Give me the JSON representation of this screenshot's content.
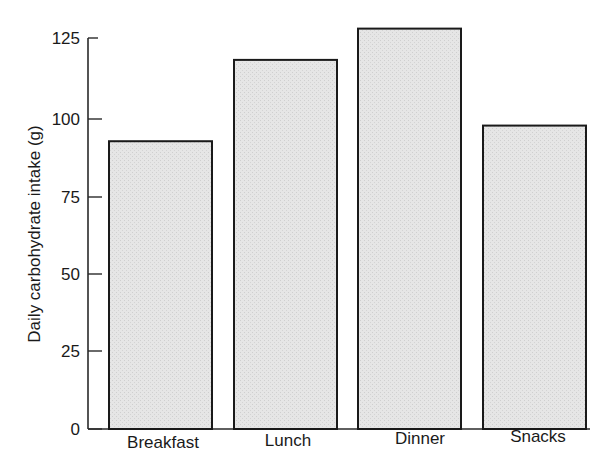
{
  "chart_data": {
    "type": "bar",
    "title": "",
    "xlabel": "",
    "ylabel": "Daily carbohydrate intake (g)",
    "categories": [
      "Breakfast",
      "Lunch",
      "Dinner",
      "Snacks"
    ],
    "values": [
      92,
      118,
      128,
      97
    ],
    "ylim": [
      0,
      125
    ],
    "yticks": [
      0,
      25,
      50,
      75,
      100,
      125
    ],
    "grid": false,
    "legend": null,
    "bar_fill": "#e3e3e3",
    "bar_stroke": "#1a1a1a"
  },
  "axis": {
    "ylabel": "Daily carbohydrate intake (g)",
    "yticks": [
      "0",
      "25",
      "50",
      "75",
      "100",
      "125"
    ],
    "categories": [
      "Breakfast",
      "Lunch",
      "Dinner",
      "Snacks"
    ]
  }
}
